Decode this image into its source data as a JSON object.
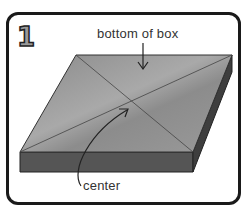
{
  "step_number": "1",
  "labels": {
    "bottom": "bottom of box",
    "center": "center"
  },
  "colors": {
    "top_face": "#8f8f8f",
    "side_face": "#555555",
    "outline": "#1a1a1a"
  }
}
